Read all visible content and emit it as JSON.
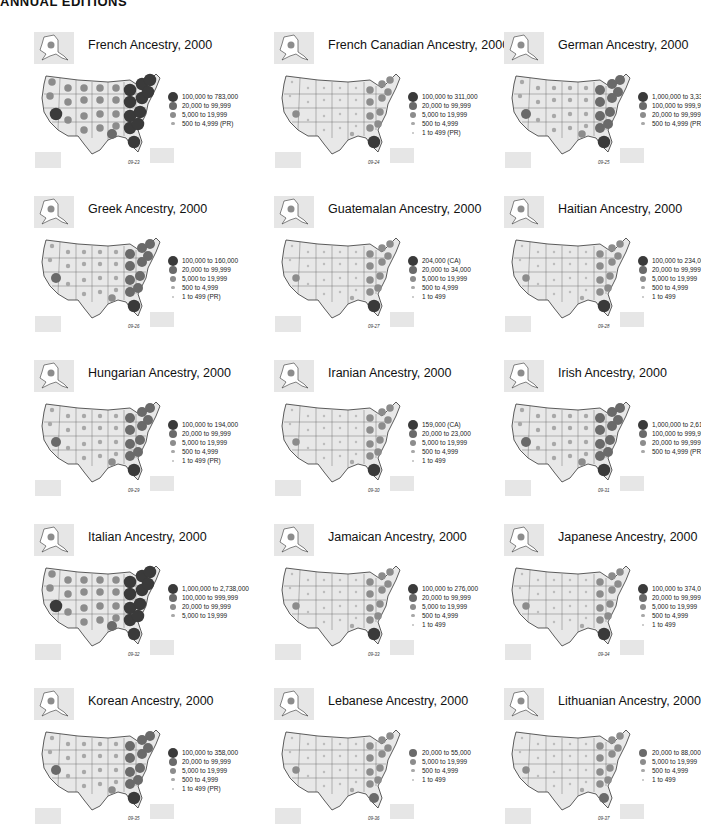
{
  "header": {
    "title": "ANNUAL EDITIONS"
  },
  "colors": {
    "map_fill": "#e8e8e8",
    "map_stroke": "#333333",
    "inset_bg": "#e6e6e6",
    "tier1": "#3a3a3a",
    "tier2": "#6a6a6a",
    "tier3": "#8c8c8c",
    "tier4": "#a8a8a8",
    "tier5": "#bdbdbd"
  },
  "chart_data": [
    {
      "type": "bubble-map",
      "title": "French Ancestry, 2000",
      "figure_id": "09-23",
      "legend": [
        {
          "label": "100,000 to 783,000",
          "tier": 1
        },
        {
          "label": "20,000 to 99,999",
          "tier": 2
        },
        {
          "label": "5,000 to 19,999",
          "tier": 3
        },
        {
          "label": "500 to 4,999 (PR)",
          "tier": 4
        }
      ]
    },
    {
      "type": "bubble-map",
      "title": "French Canadian Ancestry, 2000",
      "figure_id": "09-24",
      "legend": [
        {
          "label": "100,000 to 311,000",
          "tier": 1
        },
        {
          "label": "20,000 to 99,999",
          "tier": 2
        },
        {
          "label": "5,000 to 19,999",
          "tier": 3
        },
        {
          "label": "500 to 4,999",
          "tier": 4
        },
        {
          "label": "1 to 499 (PR)",
          "tier": 5
        }
      ]
    },
    {
      "type": "bubble-map",
      "title": "German Ancestry, 2000",
      "figure_id": "09-25",
      "legend": [
        {
          "label": "1,000,000 to 3,333,000",
          "tier": 1
        },
        {
          "label": "100,000 to 999,999",
          "tier": 2
        },
        {
          "label": "20,000 to 99,999",
          "tier": 3
        },
        {
          "label": "500 to 4,999 (PR)",
          "tier": 4
        }
      ]
    },
    {
      "type": "bubble-map",
      "title": "Greek Ancestry, 2000",
      "figure_id": "09-26",
      "legend": [
        {
          "label": "100,000 to 160,000",
          "tier": 1
        },
        {
          "label": "20,000 to 99,999",
          "tier": 2
        },
        {
          "label": "5,000 to 19,999",
          "tier": 3
        },
        {
          "label": "500 to 4,999",
          "tier": 4
        },
        {
          "label": "1 to 499 (PR)",
          "tier": 5
        }
      ]
    },
    {
      "type": "bubble-map",
      "title": "Guatemalan Ancestry, 2000",
      "figure_id": "09-27",
      "legend": [
        {
          "label": "204,000 (CA)",
          "tier": 1
        },
        {
          "label": "20,000 to 34,000",
          "tier": 2
        },
        {
          "label": "5,000 to 19,999",
          "tier": 3
        },
        {
          "label": "500 to 4,999",
          "tier": 4
        },
        {
          "label": "1 to 499",
          "tier": 5
        }
      ]
    },
    {
      "type": "bubble-map",
      "title": "Haitian Ancestry, 2000",
      "figure_id": "09-28",
      "legend": [
        {
          "label": "100,000 to 234,000",
          "tier": 1
        },
        {
          "label": "20,000 to 99,999",
          "tier": 2
        },
        {
          "label": "5,000 to 19,999",
          "tier": 3
        },
        {
          "label": "500 to 4,999",
          "tier": 4
        },
        {
          "label": "1 to 499",
          "tier": 5
        }
      ]
    },
    {
      "type": "bubble-map",
      "title": "Hungarian Ancestry, 2000",
      "figure_id": "09-29",
      "legend": [
        {
          "label": "100,000 to 194,000",
          "tier": 1
        },
        {
          "label": "20,000 to 99,999",
          "tier": 2
        },
        {
          "label": "5,000 to 19,999",
          "tier": 3
        },
        {
          "label": "500 to 4,999",
          "tier": 4
        },
        {
          "label": "1 to 499 (PR)",
          "tier": 5
        }
      ]
    },
    {
      "type": "bubble-map",
      "title": "Iranian Ancestry, 2000",
      "figure_id": "09-30",
      "legend": [
        {
          "label": "159,000 (CA)",
          "tier": 1
        },
        {
          "label": "20,000 to 23,000",
          "tier": 2
        },
        {
          "label": "5,000 to 19,999",
          "tier": 3
        },
        {
          "label": "500 to 4,999",
          "tier": 4
        },
        {
          "label": "1 to 499",
          "tier": 5
        }
      ]
    },
    {
      "type": "bubble-map",
      "title": "Irish Ancestry, 2000",
      "figure_id": "09-31",
      "legend": [
        {
          "label": "1,000,000 to 2,612,000",
          "tier": 1
        },
        {
          "label": "100,000 to 999,999",
          "tier": 2
        },
        {
          "label": "20,000 to 99,999",
          "tier": 3
        },
        {
          "label": "500 to 4,999 (PR)",
          "tier": 4
        }
      ]
    },
    {
      "type": "bubble-map",
      "title": "Italian Ancestry, 2000",
      "figure_id": "09-32",
      "legend": [
        {
          "label": "1,000,000 to 2,738,000",
          "tier": 1
        },
        {
          "label": "100,000 to 999,999",
          "tier": 2
        },
        {
          "label": "20,000 to 99,999",
          "tier": 3
        },
        {
          "label": "5,000 to 19,999",
          "tier": 4
        }
      ]
    },
    {
      "type": "bubble-map",
      "title": "Jamaican Ancestry, 2000",
      "figure_id": "09-33",
      "legend": [
        {
          "label": "100,000 to 276,000",
          "tier": 1
        },
        {
          "label": "20,000 to 99,999",
          "tier": 2
        },
        {
          "label": "5,000 to 19,999",
          "tier": 3
        },
        {
          "label": "500 to 4,999",
          "tier": 4
        },
        {
          "label": "1 to 499",
          "tier": 5
        }
      ]
    },
    {
      "type": "bubble-map",
      "title": "Japanese Ancestry, 2000",
      "figure_id": "09-34",
      "legend": [
        {
          "label": "100,000 to 374,000",
          "tier": 1
        },
        {
          "label": "20,000 to 99,999",
          "tier": 2
        },
        {
          "label": "5,000 to 19,999",
          "tier": 3
        },
        {
          "label": "500 to 4,999",
          "tier": 4
        },
        {
          "label": "1 to 499",
          "tier": 5
        }
      ]
    },
    {
      "type": "bubble-map",
      "title": "Korean Ancestry, 2000",
      "figure_id": "09-35",
      "legend": [
        {
          "label": "100,000 to 358,000",
          "tier": 1
        },
        {
          "label": "20,000 to 99,999",
          "tier": 2
        },
        {
          "label": "5,000 to 19,999",
          "tier": 3
        },
        {
          "label": "500 to 4,999",
          "tier": 4
        },
        {
          "label": "1 to 499 (PR)",
          "tier": 5
        }
      ]
    },
    {
      "type": "bubble-map",
      "title": "Lebanese Ancestry, 2000",
      "figure_id": "09-36",
      "legend": [
        {
          "label": "20,000 to 55,000",
          "tier": 2
        },
        {
          "label": "5,000 to 19,999",
          "tier": 3
        },
        {
          "label": "500 to 4,999",
          "tier": 4
        },
        {
          "label": "1 to 499",
          "tier": 5
        }
      ]
    },
    {
      "type": "bubble-map",
      "title": "Lithuanian Ancestry, 2000",
      "figure_id": "09-37",
      "legend": [
        {
          "label": "20,000 to 88,000",
          "tier": 2
        },
        {
          "label": "5,000 to 19,999",
          "tier": 3
        },
        {
          "label": "500 to 4,999",
          "tier": 4
        },
        {
          "label": "1 to 499",
          "tier": 5
        }
      ]
    }
  ]
}
